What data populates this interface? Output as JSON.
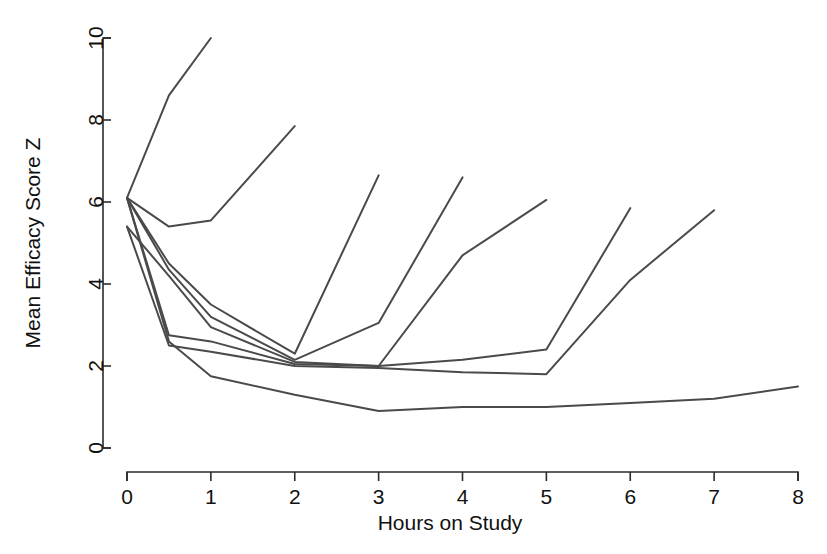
{
  "chart_data": {
    "type": "line",
    "title": "",
    "subtitle": "",
    "xlabel": "Hours on Study",
    "ylabel": "Mean Efficacy Score Z",
    "xlim": [
      0,
      8
    ],
    "ylim": [
      0,
      10
    ],
    "xticks": [
      0,
      1,
      2,
      3,
      4,
      5,
      6,
      7,
      8
    ],
    "xtick_labels": [
      "0",
      "1",
      "2",
      "3",
      "4",
      "5",
      "6",
      "7",
      "8"
    ],
    "yticks": [
      0,
      2,
      4,
      6,
      8,
      10
    ],
    "ytick_labels": [
      "0",
      "2",
      "4",
      "6",
      "8",
      "10"
    ],
    "grid": false,
    "legend": false,
    "legend_position": "none",
    "annotations": [],
    "line_color": "#4a4a4a",
    "series": [
      {
        "name": "Group 1",
        "x": [
          0,
          0.5,
          1
        ],
        "values": [
          6.1,
          8.6,
          10.0
        ]
      },
      {
        "name": "Group 2",
        "x": [
          0,
          0.5,
          1,
          2
        ],
        "values": [
          6.1,
          5.4,
          5.55,
          7.85
        ]
      },
      {
        "name": "Group 3",
        "x": [
          0,
          0.5,
          1,
          2,
          3
        ],
        "values": [
          6.1,
          4.5,
          3.5,
          2.3,
          6.65
        ]
      },
      {
        "name": "Group 4",
        "x": [
          0,
          0.5,
          1,
          2,
          3,
          4
        ],
        "values": [
          6.1,
          4.35,
          3.2,
          2.15,
          3.05,
          6.6
        ]
      },
      {
        "name": "Group 5",
        "x": [
          0,
          0.5,
          1,
          2,
          3,
          4,
          5
        ],
        "values": [
          5.4,
          4.2,
          2.95,
          2.1,
          2.0,
          4.7,
          6.05
        ]
      },
      {
        "name": "Group 6",
        "x": [
          0,
          0.5,
          1,
          2,
          3,
          4,
          5,
          6
        ],
        "values": [
          6.1,
          2.75,
          2.6,
          2.05,
          2.0,
          2.15,
          2.4,
          5.85
        ]
      },
      {
        "name": "Group 7",
        "x": [
          0,
          0.5,
          1,
          2,
          3,
          4,
          5,
          6,
          7
        ],
        "values": [
          5.4,
          2.5,
          2.35,
          2.0,
          1.95,
          1.85,
          1.8,
          4.1,
          5.8
        ]
      },
      {
        "name": "Group 8",
        "x": [
          0,
          0.5,
          1,
          2,
          3,
          4,
          5,
          6,
          7,
          8
        ],
        "values": [
          6.1,
          2.6,
          1.75,
          1.3,
          0.9,
          1.0,
          1.0,
          1.1,
          1.2,
          1.5
        ]
      }
    ]
  },
  "axes": {
    "y_axis_name": "y-axis",
    "x_axis_name": "x-axis"
  }
}
